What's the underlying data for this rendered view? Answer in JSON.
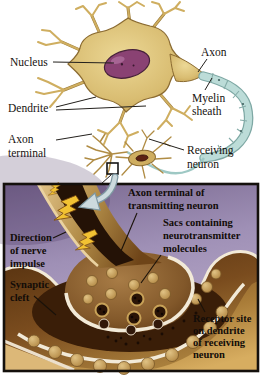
{
  "diagram": {
    "top_panel": {
      "labels": {
        "nucleus": "Nucleus",
        "dendrite": "Dendrite",
        "axon": "Axon",
        "myelin_sheath": [
          "Myelin",
          "sheath"
        ],
        "axon_terminal": [
          "Axon",
          "terminal"
        ],
        "receiving_neuron": [
          "Receiving",
          "neuron"
        ]
      }
    },
    "bottom_panel": {
      "labels": {
        "axon_terminal_transmitting": [
          "Axon terminal of",
          "transmitting neuron"
        ],
        "sacs": [
          "Sacs containing",
          "neurotransmitter",
          "molecules"
        ],
        "direction": [
          "Direction",
          "of nerve",
          "impulse"
        ],
        "synaptic_cleft": [
          "Synaptic",
          "cleft"
        ],
        "receptor_site": [
          "Receptor site",
          "on dendrite",
          "of receiving",
          "neuron"
        ]
      }
    },
    "colors": {
      "soma_tan": "#d6b96a",
      "nucleus_purple": "#8a4273",
      "myelin_blue": "#bcdcd8",
      "panel_purple": "#a394ba",
      "impulse_yellow": "#f2c233",
      "terminal_brown": "#7a5226",
      "membrane_cream": "#f2ead8",
      "vesicle_tan": "#c8a258",
      "label_ink": "#16120e"
    }
  }
}
